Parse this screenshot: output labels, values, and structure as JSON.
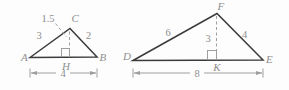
{
  "colors": {
    "triangle_line": "#3b3b3b",
    "label_text": "#8f8f8f",
    "aux_line": "#9f9f9f",
    "background": "#fdfdfd"
  },
  "left_triangle": {
    "vertices": {
      "a": "A",
      "b": "B",
      "c": "C",
      "h": "H"
    },
    "labels": {
      "side_ac": "3",
      "side_cb": "2",
      "altitude_ch": "1.5",
      "base_ab": "4"
    }
  },
  "right_triangle": {
    "vertices": {
      "d": "D",
      "e": "E",
      "f": "F",
      "k": "K"
    },
    "labels": {
      "side_df": "6",
      "side_fe": "4",
      "altitude_fk": "3",
      "base_de": "8"
    }
  }
}
